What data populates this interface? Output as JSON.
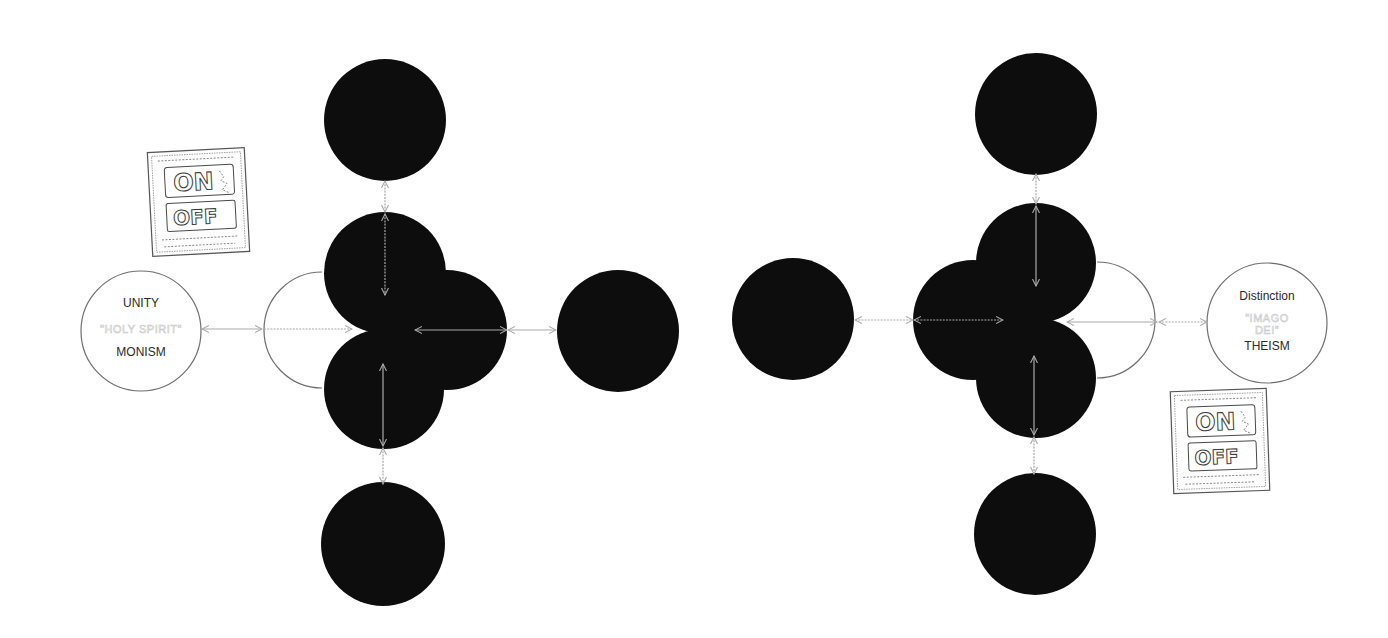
{
  "diagram": {
    "canvas": {
      "width": 1388,
      "height": 638,
      "background": "#ffffff"
    },
    "colors": {
      "node_fill": "#0d0d0d",
      "outline": "#6f6f6f",
      "connector": "#a9a9a9",
      "faint_text": "#c8c8c8",
      "dark_text": "#2a2a2a"
    },
    "left_label_node": {
      "cx": 141,
      "cy": 331,
      "r": 60,
      "lines": [
        {
          "text": "UNITY",
          "style": "dark",
          "y": 307
        },
        {
          "text": "\"HOLY SPIRIT\"",
          "style": "faint",
          "y": 333
        },
        {
          "text": "MONISM",
          "style": "dark",
          "y": 356
        }
      ]
    },
    "right_label_node": {
      "cx": 1267,
      "cy": 323,
      "r": 60,
      "lines": [
        {
          "text": "Distinction",
          "style": "dark",
          "y": 300
        },
        {
          "text": "\"IMAGO",
          "style": "faint",
          "y": 322
        },
        {
          "text": "DEI\"",
          "style": "faint",
          "y": 334
        },
        {
          "text": "THEISM",
          "style": "dark",
          "y": 350
        }
      ]
    },
    "left_cluster": {
      "semicircle": {
        "cx": 322,
        "cy": 330,
        "r": 58,
        "side": "left"
      },
      "circles": [
        {
          "name": "left-cluster-top-lobe",
          "cx": 385,
          "cy": 273,
          "r": 61
        },
        {
          "name": "left-cluster-right-lobe",
          "cx": 447,
          "cy": 330,
          "r": 60
        },
        {
          "name": "left-cluster-bottom-lobe",
          "cx": 384,
          "cy": 389,
          "r": 60
        }
      ]
    },
    "right_cluster": {
      "semicircle": {
        "cx": 1097,
        "cy": 320,
        "r": 58,
        "side": "right"
      },
      "circles": [
        {
          "name": "right-cluster-top-lobe",
          "cx": 1036,
          "cy": 263,
          "r": 60
        },
        {
          "name": "right-cluster-left-lobe",
          "cx": 973,
          "cy": 320,
          "r": 60
        },
        {
          "name": "right-cluster-bottom-lobe",
          "cx": 1036,
          "cy": 378,
          "r": 60
        }
      ]
    },
    "satellite_circles": [
      {
        "name": "left-top-satellite",
        "cx": 385,
        "cy": 120,
        "r": 61
      },
      {
        "name": "left-bottom-satellite",
        "cx": 383,
        "cy": 544,
        "r": 62
      },
      {
        "name": "center-left-circle",
        "cx": 618,
        "cy": 331,
        "r": 61
      },
      {
        "name": "center-right-circle",
        "cx": 793,
        "cy": 319,
        "r": 61
      },
      {
        "name": "right-top-satellite",
        "cx": 1036,
        "cy": 114,
        "r": 61
      },
      {
        "name": "right-bottom-satellite",
        "cx": 1035,
        "cy": 534,
        "r": 61
      }
    ],
    "connectors": [
      {
        "name": "unity-to-semicircle",
        "x1": 202,
        "y1": 329,
        "x2": 262,
        "y2": 329,
        "arrows": "both",
        "dashed": false
      },
      {
        "name": "semicircle-to-left-notch",
        "x1": 264,
        "y1": 329,
        "x2": 352,
        "y2": 329,
        "arrows": "end",
        "dashed": true
      },
      {
        "name": "left-lobe-horizontal",
        "x1": 415,
        "y1": 330,
        "x2": 507,
        "y2": 330,
        "arrows": "both",
        "dashed": false
      },
      {
        "name": "left-lobe-to-center-left",
        "x1": 508,
        "y1": 330,
        "x2": 556,
        "y2": 330,
        "arrows": "both",
        "dashed": false
      },
      {
        "name": "left-top-satellite-to-top-lobe",
        "x1": 385,
        "y1": 181,
        "x2": 385,
        "y2": 212,
        "arrows": "both",
        "dashed": true
      },
      {
        "name": "left-top-lobe-vertical",
        "x1": 385,
        "y1": 214,
        "x2": 385,
        "y2": 295,
        "arrows": "both",
        "dashed": true
      },
      {
        "name": "left-bottom-lobe-vertical",
        "x1": 383,
        "y1": 364,
        "x2": 383,
        "y2": 446,
        "arrows": "both",
        "dashed": false
      },
      {
        "name": "left-bottom-lobe-to-satellite",
        "x1": 383,
        "y1": 448,
        "x2": 383,
        "y2": 484,
        "arrows": "both",
        "dashed": true
      },
      {
        "name": "center-right-to-right-lobe",
        "x1": 855,
        "y1": 320,
        "x2": 913,
        "y2": 320,
        "arrows": "both",
        "dashed": true
      },
      {
        "name": "right-lobe-horizontal",
        "x1": 914,
        "y1": 320,
        "x2": 1003,
        "y2": 320,
        "arrows": "both",
        "dashed": true
      },
      {
        "name": "right-notch-to-semicircle",
        "x1": 1067,
        "y1": 322,
        "x2": 1157,
        "y2": 322,
        "arrows": "both",
        "dashed": false
      },
      {
        "name": "semicircle-to-distinction",
        "x1": 1159,
        "y1": 322,
        "x2": 1207,
        "y2": 322,
        "arrows": "both",
        "dashed": true
      },
      {
        "name": "right-top-satellite-to-top-lobe",
        "x1": 1036,
        "y1": 174,
        "x2": 1036,
        "y2": 204,
        "arrows": "both",
        "dashed": true
      },
      {
        "name": "right-top-lobe-vertical",
        "x1": 1036,
        "y1": 206,
        "x2": 1036,
        "y2": 286,
        "arrows": "both",
        "dashed": false
      },
      {
        "name": "right-bottom-lobe-vertical",
        "x1": 1034,
        "y1": 356,
        "x2": 1034,
        "y2": 435,
        "arrows": "both",
        "dashed": false
      },
      {
        "name": "right-bottom-lobe-to-satellite",
        "x1": 1034,
        "y1": 437,
        "x2": 1034,
        "y2": 474,
        "arrows": "both",
        "dashed": true
      }
    ],
    "switch_signs": [
      {
        "name": "left-on-off-sign",
        "x": 150,
        "y": 150,
        "w": 97,
        "h": 104,
        "rotate": -3,
        "on_label": "ON",
        "off_label": "OFF"
      },
      {
        "name": "right-on-off-sign",
        "x": 1172,
        "y": 390,
        "w": 96,
        "h": 102,
        "rotate": -2,
        "on_label": "ON",
        "off_label": "OFF"
      }
    ]
  }
}
